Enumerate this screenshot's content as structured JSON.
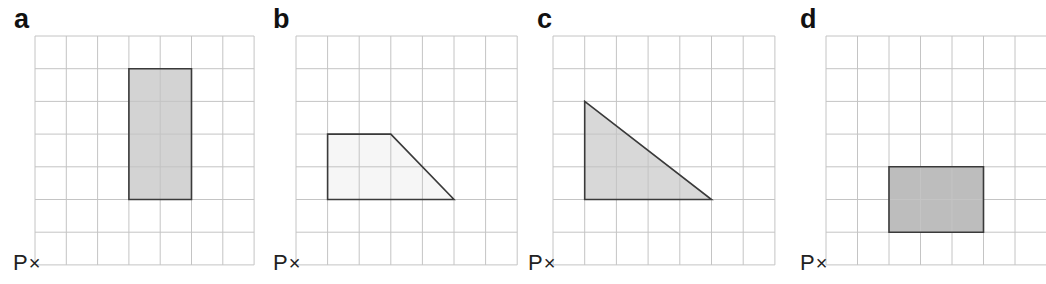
{
  "grid": {
    "columns": 7,
    "rows": 7,
    "line_color": "#c4c4c4",
    "shape_stroke": "#3a3a3a"
  },
  "origin_label": {
    "letter": "P",
    "marker": "×"
  },
  "panels": [
    {
      "label": "a",
      "grid_left": 35,
      "grid_top": 36,
      "cell_w": 31.3,
      "cell_h": 32.7,
      "shape": {
        "type": "rectangle",
        "fill": "#d3d3d3",
        "points": [
          [
            3,
            1
          ],
          [
            5,
            1
          ],
          [
            5,
            5
          ],
          [
            3,
            5
          ]
        ]
      }
    },
    {
      "label": "b",
      "grid_left": 296,
      "grid_top": 36,
      "cell_w": 31.6,
      "cell_h": 32.7,
      "shape": {
        "type": "trapezium",
        "fill": "#f6f6f6",
        "points": [
          [
            1,
            3
          ],
          [
            3,
            3
          ],
          [
            5,
            5
          ],
          [
            1,
            5
          ]
        ]
      }
    },
    {
      "label": "c",
      "grid_left": 553,
      "grid_top": 36,
      "cell_w": 31.7,
      "cell_h": 32.7,
      "shape": {
        "type": "right-triangle",
        "fill": "#d8d8d8",
        "points": [
          [
            1,
            2
          ],
          [
            1,
            5
          ],
          [
            5,
            5
          ]
        ]
      }
    },
    {
      "label": "d",
      "grid_left": 826,
      "grid_top": 36,
      "cell_w": 31.5,
      "cell_h": 32.7,
      "shape": {
        "type": "rectangle",
        "fill": "#bdbdbd",
        "points": [
          [
            2,
            4
          ],
          [
            5,
            4
          ],
          [
            5,
            6
          ],
          [
            2,
            6
          ]
        ]
      }
    }
  ]
}
